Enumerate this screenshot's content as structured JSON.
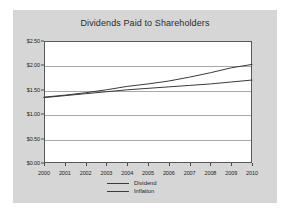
{
  "chart_data": {
    "type": "line",
    "title": "Dividends Paid to Shareholders",
    "xlabel": "",
    "ylabel": "",
    "categories": [
      "2000",
      "2001",
      "2002",
      "2003",
      "2004",
      "2005",
      "2006",
      "2007",
      "2008",
      "2009",
      "2010"
    ],
    "series": [
      {
        "name": "Dividend",
        "values": [
          1.35,
          1.39,
          1.44,
          1.5,
          1.57,
          1.62,
          1.68,
          1.76,
          1.85,
          1.95,
          2.02
        ],
        "color": "#3a3a3a"
      },
      {
        "name": "Inflation",
        "values": [
          1.34,
          1.38,
          1.42,
          1.46,
          1.5,
          1.53,
          1.56,
          1.59,
          1.62,
          1.66,
          1.7
        ],
        "color": "#3a3a3a"
      }
    ],
    "ylim": [
      0.0,
      2.5
    ],
    "ytick_values": [
      0.0,
      0.5,
      1.0,
      1.5,
      2.0,
      2.5
    ],
    "ytick_labels": [
      "$0.00",
      "$0.50",
      "$1.00",
      "$1.50",
      "$2.00",
      "$2.50"
    ],
    "grid": "horizontal",
    "legend_position": "bottom-center",
    "legend_entries": [
      "Dividend",
      "Inflation"
    ],
    "plot_background": "#ffffff",
    "panel_background": "#d6d6d6",
    "grid_color": "#a8a8a8",
    "axis_color": "#595959",
    "title_color": "#2b2b2b"
  }
}
